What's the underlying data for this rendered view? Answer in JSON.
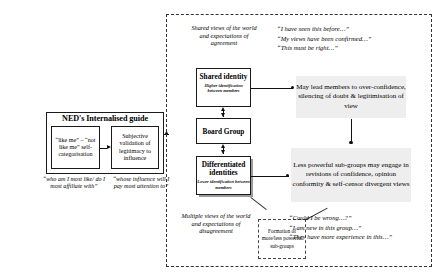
{
  "ned_panel": {
    "title": "NED's  Internalised guide",
    "left_box": "“like me” – “not like me” self-categorisation",
    "right_box": "Subjective validation of legitimacy to influence",
    "left_caption": "“who am I most like/ do I most affiliate with”",
    "right_caption": "“whose influence will I pay most attention to”"
  },
  "identity_column": {
    "shared_views_caption": "Shared views of the world and expectations of agreement",
    "shared_identity": {
      "title": "Shared identity",
      "subtitle": "Higher identification between members"
    },
    "board_group": "Board Group",
    "differentiated_identities": {
      "title": "Differentiated identities",
      "subtitle": "Lower identification between members"
    },
    "multiple_views_caption": "Multiple views of the world and expectations of disagreement",
    "subgroup_box": "Formation of more/less powerful sub-groups"
  },
  "outcomes": {
    "upper": "May lead members to over-confidence, silencing of doubt & legitimisation of view",
    "lower": "Less powerful sub-groups may engage in revisions of confidence, opinion conformity & self-censor divergent views"
  },
  "quotes": {
    "top": [
      "“I have seen this before…”",
      "“My views have been confirmed…”",
      "“This must be right…”"
    ],
    "bottom": [
      "“Could I be wrong…?”",
      "“I am new in this group…”",
      "“They have more experience in this…”"
    ]
  },
  "colors": {
    "outcome_block_fill": "#eeeeee",
    "line": "#111111",
    "dashed_border": "#333333",
    "shadow": "#9a9a9a"
  }
}
